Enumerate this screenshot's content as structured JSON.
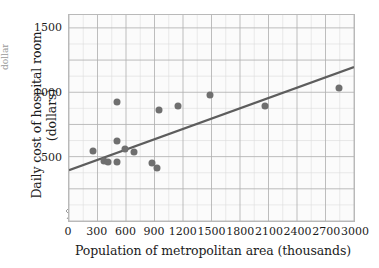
{
  "figure": {
    "edge_fragment": "dollars",
    "background": "#ffffff",
    "frame_color": "#b9b9b9",
    "plot_background": "#fbfbfb"
  },
  "chart_data": {
    "type": "scatter",
    "title": "",
    "subtitle": "",
    "xlabel": "Population of metropolitan area (thousands)",
    "ylabel": "Daily cost of hospital room (dollars)",
    "xlim": [
      0,
      3000
    ],
    "ylim": [
      0,
      1600
    ],
    "xticks": [
      0,
      300,
      600,
      900,
      1200,
      1500,
      1800,
      2100,
      2400,
      2700,
      3000
    ],
    "xtick_labels": [
      "0",
      "300",
      "600",
      "900",
      "1200",
      "1500",
      "1800",
      "2100",
      "2400",
      "2700",
      "3000"
    ],
    "yticks": [
      500,
      1000,
      1500
    ],
    "ytick_labels": [
      "500",
      "1000",
      "1500"
    ],
    "grid": true,
    "grid_major_x": 300,
    "grid_minor_x": 150,
    "grid_major_y": 250,
    "grid_minor_y": 125,
    "legend": false,
    "legend_position": "none",
    "axis_break": true,
    "marker_color": "#6f6f6f",
    "marker_size": 7,
    "trendline_color": "#5d5d5d",
    "points": [
      {
        "x": 260,
        "y": 550
      },
      {
        "x": 380,
        "y": 470
      },
      {
        "x": 420,
        "y": 460
      },
      {
        "x": 510,
        "y": 920
      },
      {
        "x": 510,
        "y": 620
      },
      {
        "x": 510,
        "y": 465
      },
      {
        "x": 600,
        "y": 565
      },
      {
        "x": 690,
        "y": 535
      },
      {
        "x": 880,
        "y": 455
      },
      {
        "x": 930,
        "y": 415
      },
      {
        "x": 950,
        "y": 865
      },
      {
        "x": 1150,
        "y": 890
      },
      {
        "x": 1480,
        "y": 975
      },
      {
        "x": 2060,
        "y": 890
      },
      {
        "x": 2830,
        "y": 1030
      }
    ],
    "trendline": {
      "x0": 0,
      "y0": 395,
      "x1": 3000,
      "y1": 1195,
      "slope": 0.2667,
      "intercept": 395
    }
  }
}
